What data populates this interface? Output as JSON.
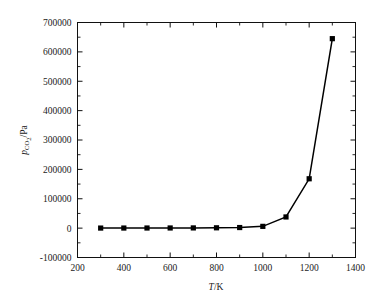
{
  "chart_data": {
    "type": "line",
    "title": "",
    "xlabel": "T/K",
    "ylabel": "pCO2 /Pa",
    "ylabel_parts": {
      "symbol": "p",
      "subscript": "CO",
      "subscript_number": "2",
      "unit": "/Pa"
    },
    "xlabel_parts": {
      "symbol": "T",
      "unit": "/K"
    },
    "xlim": [
      200,
      1400
    ],
    "ylim": [
      -100000,
      700000
    ],
    "xticks": [
      200,
      400,
      600,
      800,
      1000,
      1200,
      1400
    ],
    "xtick_labels": [
      "200",
      "400",
      "600",
      "800",
      "1000",
      "1200",
      "1400"
    ],
    "xminor_ticks": [
      300,
      500,
      700,
      900,
      1100,
      1300
    ],
    "yticks": [
      -100000,
      0,
      100000,
      200000,
      300000,
      400000,
      500000,
      600000,
      700000
    ],
    "ytick_labels": [
      "-100000",
      "0",
      "100000",
      "200000",
      "300000",
      "400000",
      "500000",
      "600000",
      "700000"
    ],
    "yminor_ticks": [
      -50000,
      50000,
      150000,
      250000,
      350000,
      450000,
      550000,
      650000
    ],
    "grid": false,
    "legend": false,
    "legend_position": "none",
    "marker": "square-filled",
    "marker_color": "#000000",
    "line_color": "#000000",
    "x": [
      300,
      400,
      500,
      600,
      700,
      800,
      900,
      1000,
      1100,
      1200,
      1300
    ],
    "values": [
      200,
      300,
      400,
      500,
      700,
      1100,
      2000,
      6000,
      38000,
      168000,
      645000
    ],
    "series": [
      {
        "name": "pCO2",
        "x": [
          300,
          400,
          500,
          600,
          700,
          800,
          900,
          1000,
          1100,
          1200,
          1300
        ],
        "values": [
          200,
          300,
          400,
          500,
          700,
          1100,
          2000,
          6000,
          38000,
          168000,
          645000
        ]
      }
    ]
  }
}
